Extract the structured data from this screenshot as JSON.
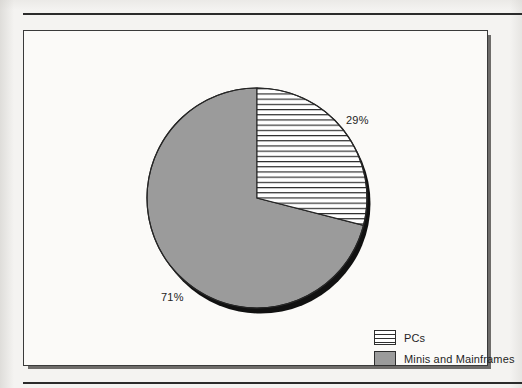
{
  "figure": {
    "background_color": "#fbfaf8",
    "page_color": "#f4f3f1",
    "border_color": "#3a3a3a"
  },
  "labels": {
    "pcs_pct": "29%",
    "minis_pct": "71%"
  },
  "legend": {
    "items": [
      {
        "label": "PCs",
        "swatch": "horizontal-hatch",
        "color": "#ffffff"
      },
      {
        "label": "Minis and Mainframes",
        "swatch": "solid-gray",
        "color": "#9b9b9b"
      }
    ]
  },
  "chart_data": {
    "type": "pie",
    "title": "",
    "subtitle": "",
    "xlabel": "",
    "ylabel": "",
    "categories": [
      "PCs",
      "Minis and Mainframes"
    ],
    "values": [
      29,
      71
    ],
    "value_unit": "percent",
    "data_labels": [
      "29%",
      "71%"
    ],
    "slice_styles": [
      "horizontal-hatch-on-white",
      "solid-gray"
    ],
    "slice_colors": [
      "#ffffff",
      "#9b9b9b"
    ],
    "start_angle_deg": 0,
    "direction": "clockwise",
    "legend": true,
    "legend_position": "bottom-right",
    "grid": false,
    "effect": "3d-drop-shadow"
  }
}
